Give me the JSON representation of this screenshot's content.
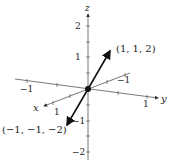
{
  "axes": {
    "x_label": "x",
    "y_label": "y",
    "z_label": "z",
    "ticks": {
      "z_pos2": "2",
      "z_pos1": "1",
      "z_neg1": "−1",
      "z_neg2": "−2",
      "y_neg1": "−1",
      "y_pos1": "1",
      "x_neg1": "−1",
      "x_pos1": "1"
    }
  },
  "vectors": [
    {
      "label": "(1, 1, 2)",
      "components": [
        1,
        1,
        2
      ]
    },
    {
      "label": "(−1, −1, −2)",
      "components": [
        -1,
        -1,
        -2
      ]
    }
  ],
  "colors": {
    "line": "#333333",
    "vector": "#111111"
  }
}
